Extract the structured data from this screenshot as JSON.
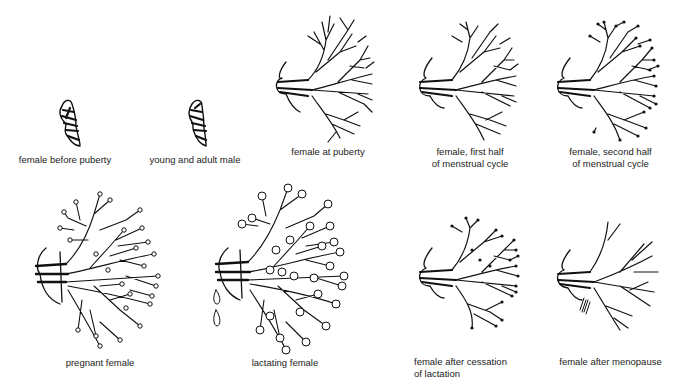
{
  "figure": {
    "panels": [
      {
        "id": "female-before-puberty",
        "label": "female before puberty",
        "bud": "small",
        "terminals": "none"
      },
      {
        "id": "young-and-adult-male",
        "label": "young and adult male",
        "bud": "small",
        "terminals": "none"
      },
      {
        "id": "female-at-puberty",
        "label": "female at puberty",
        "bud": "branched",
        "terminals": "none"
      },
      {
        "id": "female-first-half-menstrual",
        "label": "female, first half\nof menstrual cycle",
        "bud": "branched",
        "terminals": "none"
      },
      {
        "id": "female-second-half-menstrual",
        "label": "female, second half\nof menstrual cycle",
        "bud": "branched",
        "terminals": "dots"
      },
      {
        "id": "pregnant-female",
        "label": "pregnant female",
        "bud": "dense",
        "terminals": "small-circles"
      },
      {
        "id": "lactating-female",
        "label": "lactating female",
        "bud": "dense",
        "terminals": "large-circles",
        "extra": "milk-drops"
      },
      {
        "id": "female-after-cessation-lactation",
        "label": "female after cessation\nof lactation",
        "bud": "branched",
        "terminals": "dots"
      },
      {
        "id": "female-after-menopause",
        "label": "female after menopause",
        "bud": "sparse",
        "terminals": "none"
      }
    ]
  },
  "colors": {
    "ink": "#111111",
    "background": "#ffffff",
    "text": "#222222"
  }
}
